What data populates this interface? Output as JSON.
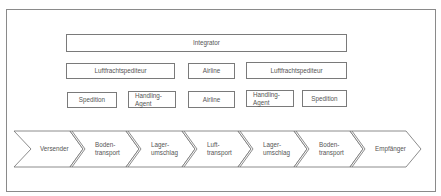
{
  "diagram": {
    "top_bar": {
      "label": "Integrator"
    },
    "row2": [
      {
        "label": "Luftfrachtspediteur"
      },
      {
        "label": "Airline"
      },
      {
        "label": "Luftfrachtspediteur"
      }
    ],
    "row3": [
      {
        "label": "Spedition"
      },
      {
        "label": "Handling-\nAgent"
      },
      {
        "label": "Airline"
      },
      {
        "label": "Handling-\nAgent"
      },
      {
        "label": "Spedition"
      }
    ],
    "process_chain": [
      {
        "label": "Versender"
      },
      {
        "label": "Boden-\ntransport"
      },
      {
        "label": "Lager-\numschlag"
      },
      {
        "label": "Luft-\ntransport"
      },
      {
        "label": "Lager-\numschlag"
      },
      {
        "label": "Boden-\ntransport"
      },
      {
        "label": "Empfänger"
      }
    ],
    "colors": {
      "stroke": "#7a7a7a",
      "text": "#555555",
      "background": "#ffffff"
    }
  }
}
